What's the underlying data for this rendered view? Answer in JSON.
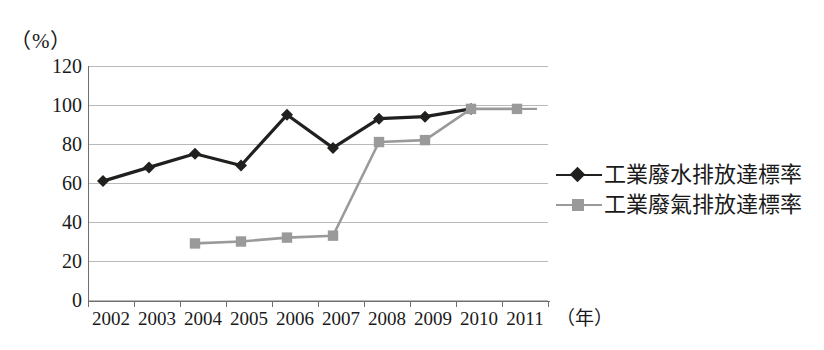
{
  "chart_data": {
    "type": "line",
    "title": "",
    "xlabel": "年",
    "ylabel": "%",
    "y_unit_label": "（%）",
    "x_unit_label": "（年）",
    "categories": [
      "2002",
      "2003",
      "2004",
      "2005",
      "2006",
      "2007",
      "2008",
      "2009",
      "2010",
      "2011"
    ],
    "ylim": [
      0,
      120
    ],
    "ytick_labels": [
      "120",
      "100",
      "80",
      "60",
      "40",
      "20",
      "0"
    ],
    "yticks": [
      120,
      100,
      80,
      60,
      40,
      20,
      0
    ],
    "grid": true,
    "legend_position": "right",
    "series": [
      {
        "name": "工業廢水排放達標率",
        "marker": "diamond",
        "color": "#20201f",
        "values": [
          61,
          68,
          75,
          69,
          95,
          78,
          93,
          94,
          98,
          null
        ]
      },
      {
        "name": "工業廢氣排放達標率",
        "marker": "square",
        "color": "#9a9a9a",
        "values": [
          null,
          null,
          29,
          30,
          32,
          33,
          81,
          82,
          98,
          98
        ]
      }
    ]
  },
  "legend": {
    "items": [
      {
        "label": "工業廢水排放達標率",
        "marker": "diamond-marker",
        "color": "#20201f"
      },
      {
        "label": "工業廢氣排放達標率",
        "marker": "square-marker",
        "color": "#9a9a9a"
      }
    ]
  }
}
